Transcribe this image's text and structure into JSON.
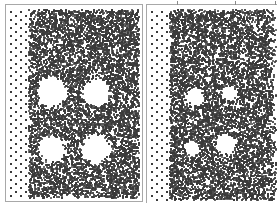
{
  "figure": {
    "panels": [
      {
        "id": "left",
        "voids": [
          {
            "cx": 0.33,
            "cy": 0.44,
            "r": 0.11
          },
          {
            "cx": 0.66,
            "cy": 0.44,
            "r": 0.1
          },
          {
            "cx": 0.33,
            "cy": 0.73,
            "r": 0.1
          },
          {
            "cx": 0.66,
            "cy": 0.73,
            "r": 0.11
          }
        ],
        "dot_color": "#3a3a3a",
        "sparse_left_columns": 4
      },
      {
        "id": "right",
        "voids": [
          {
            "cx": 0.36,
            "cy": 0.46,
            "r": 0.07
          },
          {
            "cx": 0.62,
            "cy": 0.44,
            "r": 0.06
          },
          {
            "cx": 0.34,
            "cy": 0.72,
            "r": 0.06
          },
          {
            "cx": 0.6,
            "cy": 0.7,
            "r": 0.08
          }
        ],
        "dot_color": "#3a3a3a",
        "sparse_left_columns": 4
      }
    ],
    "frame_color": "#a8a8a8"
  }
}
